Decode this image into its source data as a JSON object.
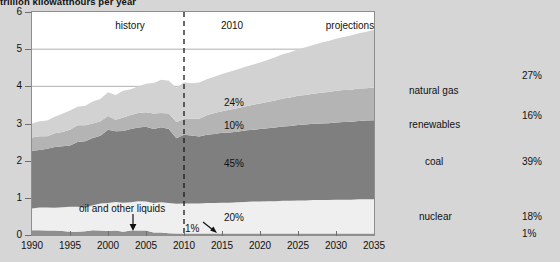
{
  "chart_data": {
    "type": "area",
    "title": "trillion kilowatthours per year",
    "xlabel": "",
    "ylabel": "",
    "xlim": [
      1990,
      2035
    ],
    "ylim": [
      0,
      6
    ],
    "grid": true,
    "legend_position": "inline-labels",
    "stacked": true,
    "x": [
      1990,
      1991,
      1992,
      1993,
      1994,
      1995,
      1996,
      1997,
      1998,
      1999,
      2000,
      2001,
      2002,
      2003,
      2004,
      2005,
      2006,
      2007,
      2008,
      2009,
      2010,
      2011,
      2012,
      2013,
      2014,
      2015,
      2016,
      2017,
      2018,
      2019,
      2020,
      2021,
      2022,
      2023,
      2024,
      2025,
      2026,
      2027,
      2028,
      2029,
      2030,
      2031,
      2032,
      2033,
      2034,
      2035
    ],
    "x_ticks": [
      "1990",
      "1995",
      "2000",
      "2005",
      "2010",
      "2015",
      "2020",
      "2025",
      "2030",
      "2035"
    ],
    "y_ticks": [
      "0",
      "1",
      "2",
      "3",
      "4",
      "5",
      "6"
    ],
    "series": [
      {
        "name": "oil and other liquids",
        "color": "#8f8f8f",
        "values": [
          0.13,
          0.13,
          0.12,
          0.12,
          0.11,
          0.09,
          0.09,
          0.1,
          0.13,
          0.12,
          0.11,
          0.12,
          0.09,
          0.12,
          0.12,
          0.12,
          0.07,
          0.07,
          0.05,
          0.04,
          0.04,
          0.04,
          0.04,
          0.04,
          0.04,
          0.04,
          0.04,
          0.04,
          0.04,
          0.04,
          0.04,
          0.04,
          0.04,
          0.04,
          0.04,
          0.04,
          0.04,
          0.04,
          0.04,
          0.04,
          0.04,
          0.04,
          0.04,
          0.04,
          0.04,
          0.04
        ]
      },
      {
        "name": "nuclear",
        "color": "#efefef",
        "values": [
          0.58,
          0.61,
          0.62,
          0.61,
          0.64,
          0.67,
          0.67,
          0.63,
          0.67,
          0.73,
          0.75,
          0.77,
          0.78,
          0.76,
          0.79,
          0.78,
          0.79,
          0.81,
          0.81,
          0.8,
          0.81,
          0.81,
          0.81,
          0.82,
          0.82,
          0.83,
          0.83,
          0.84,
          0.85,
          0.86,
          0.86,
          0.87,
          0.87,
          0.88,
          0.88,
          0.89,
          0.89,
          0.9,
          0.9,
          0.9,
          0.91,
          0.91,
          0.91,
          0.92,
          0.92,
          0.92
        ]
      },
      {
        "name": "coal",
        "color": "#7f7f7f",
        "values": [
          1.56,
          1.55,
          1.58,
          1.64,
          1.64,
          1.65,
          1.74,
          1.79,
          1.81,
          1.82,
          1.97,
          1.9,
          1.93,
          1.97,
          1.98,
          2.01,
          1.99,
          2.02,
          1.99,
          1.76,
          1.85,
          1.83,
          1.8,
          1.84,
          1.86,
          1.88,
          1.89,
          1.9,
          1.92,
          1.93,
          1.95,
          1.96,
          1.98,
          2.0,
          2.01,
          2.03,
          2.04,
          2.05,
          2.06,
          2.07,
          2.08,
          2.09,
          2.1,
          2.11,
          2.12,
          2.13
        ]
      },
      {
        "name": "renewables",
        "color": "#b4b4b4",
        "values": [
          0.35,
          0.37,
          0.34,
          0.37,
          0.38,
          0.42,
          0.45,
          0.43,
          0.39,
          0.39,
          0.37,
          0.31,
          0.36,
          0.38,
          0.39,
          0.39,
          0.42,
          0.38,
          0.42,
          0.44,
          0.42,
          0.45,
          0.48,
          0.52,
          0.56,
          0.58,
          0.61,
          0.63,
          0.65,
          0.67,
          0.69,
          0.71,
          0.73,
          0.75,
          0.77,
          0.79,
          0.8,
          0.81,
          0.83,
          0.84,
          0.85,
          0.86,
          0.86,
          0.87,
          0.87,
          0.88
        ]
      },
      {
        "name": "natural gas",
        "color": "#d2d2d2",
        "values": [
          0.38,
          0.4,
          0.42,
          0.44,
          0.49,
          0.52,
          0.5,
          0.53,
          0.59,
          0.6,
          0.64,
          0.67,
          0.72,
          0.69,
          0.72,
          0.77,
          0.82,
          0.9,
          0.88,
          0.92,
          0.99,
          0.95,
          0.97,
          0.97,
          0.98,
          1.0,
          1.02,
          1.04,
          1.06,
          1.08,
          1.1,
          1.13,
          1.16,
          1.19,
          1.22,
          1.25,
          1.28,
          1.31,
          1.34,
          1.37,
          1.4,
          1.43,
          1.46,
          1.49,
          1.52,
          1.55
        ]
      }
    ],
    "annotations": {
      "divider_year": "2010",
      "history_label": "history",
      "projections_label": "projections",
      "oil_callout": "oil and other liquids",
      "share_2010": {
        "natural_gas": "24%",
        "renewables": "10%",
        "coal": "45%",
        "nuclear": "20%",
        "oil": "1%"
      },
      "share_2035": {
        "natural_gas": "27%",
        "renewables": "16%",
        "coal": "39%",
        "nuclear": "18%",
        "oil": "1%"
      }
    }
  },
  "colors": {
    "background": "#d6d6d6",
    "plot_background": "#ffffff",
    "axis": "#8e8e8e",
    "gridline": "#9a9a9a",
    "text": "#111111",
    "natural_gas": "#d2d2d2",
    "renewables": "#b4b4b4",
    "coal": "#7f7f7f",
    "nuclear": "#efefef",
    "oil": "#8f8f8f"
  }
}
